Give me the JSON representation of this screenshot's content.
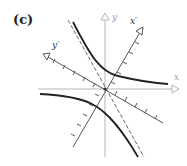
{
  "panel": {
    "label": "(c)"
  },
  "axes": {
    "x_label": "x",
    "y_label": "y",
    "x_prime_label": "x′",
    "y_prime_label": "y′"
  },
  "colors": {
    "axis": "#b0b0b0",
    "rotated_axis": "#555555",
    "curve": "#222222",
    "asymptote": "#666666"
  }
}
